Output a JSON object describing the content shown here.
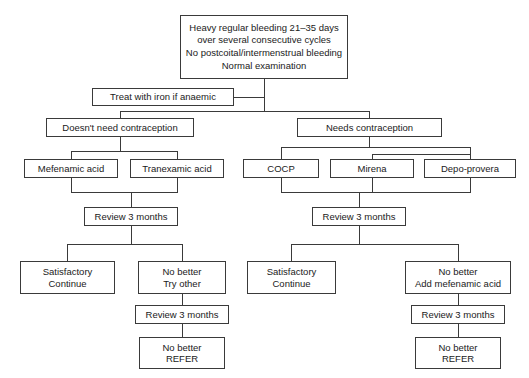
{
  "diagram": {
    "background_color": "#ffffff",
    "line_color": "#3a3a3a",
    "text_color": "#1a1a1a"
  },
  "nodes": {
    "presentation": {
      "line1": "Heavy regular bleeding 21–35 days",
      "line2": "over several consecutive cycles",
      "line3": "No postcoital/intermenstrual bleeding",
      "line4": "Normal examination"
    },
    "iron": {
      "label": "Treat with iron if anaemic"
    },
    "no_contraception": {
      "label": "Doesn't need contraception"
    },
    "needs_contraception": {
      "label": "Needs contraception"
    },
    "mefenamic_acid": {
      "label": "Mefenamic acid"
    },
    "tranexamic_acid": {
      "label": "Tranexamic acid"
    },
    "cocp": {
      "label": "COCP"
    },
    "mirena": {
      "label": "Mirena"
    },
    "depo_provera": {
      "label": "Depo-provera"
    },
    "review_left_1": {
      "label": "Review 3 months"
    },
    "review_right_1": {
      "label": "Review 3 months"
    },
    "satisfactory_left": {
      "line1": "Satisfactory",
      "line2": "Continue"
    },
    "no_better_try_other": {
      "line1": "No better",
      "line2": "Try other"
    },
    "satisfactory_right": {
      "line1": "Satisfactory",
      "line2": "Continue"
    },
    "no_better_add_mefenamic": {
      "line1": "No better",
      "line2": "Add mefenamic acid"
    },
    "review_left_2": {
      "label": "Review 3 months"
    },
    "review_right_2": {
      "label": "Review 3 months"
    },
    "refer_left": {
      "line1": "No better",
      "line2": "REFER"
    },
    "refer_right": {
      "line1": "No better",
      "line2": "REFER"
    }
  }
}
